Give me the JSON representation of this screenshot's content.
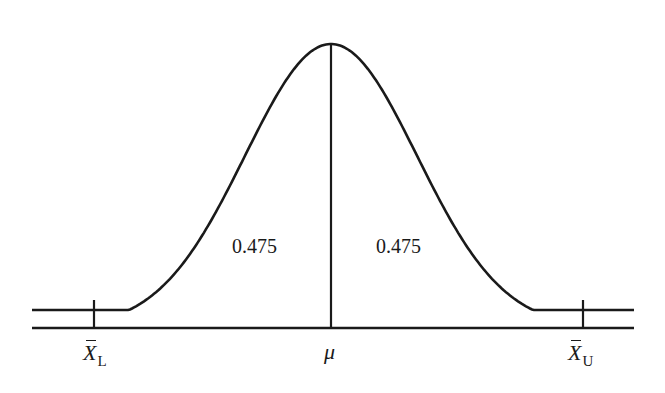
{
  "diagram": {
    "type": "normal-distribution-curve",
    "line_color": "#1a1a1a",
    "background": "#ffffff",
    "regions": [
      {
        "label": "0.475",
        "side": "left",
        "between": [
          "X̄_L",
          "μ"
        ]
      },
      {
        "label": "0.475",
        "side": "right",
        "between": [
          "μ",
          "X̄_U"
        ]
      }
    ],
    "axis_labels": {
      "lower": {
        "symbol": "X",
        "subscript": "L"
      },
      "mean": "μ",
      "upper": {
        "symbol": "X",
        "subscript": "U"
      }
    }
  }
}
